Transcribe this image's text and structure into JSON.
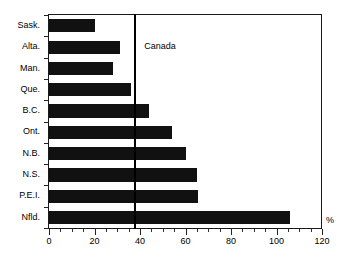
{
  "chart_data": {
    "type": "bar",
    "orientation": "horizontal",
    "title": "",
    "xlabel": "%",
    "ylabel": "",
    "categories": [
      "Sask.",
      "Alta.",
      "Man.",
      "Que.",
      "B.C.",
      "Ont.",
      "N.B.",
      "N.S.",
      "P.E.I.",
      "Nfld."
    ],
    "values": [
      20,
      31,
      28,
      36,
      44,
      54,
      60,
      65,
      65.5,
      106
    ],
    "xlim": [
      0,
      120
    ],
    "xticks": [
      0,
      20,
      40,
      60,
      80,
      100,
      120
    ],
    "xtick_labels": [
      "0",
      "20",
      "40",
      "60",
      "80",
      "100",
      "120"
    ],
    "minor_tick_interval": 5,
    "grid": false,
    "legend": null,
    "bar_color": "#111111",
    "reference_line": {
      "label": "Canada",
      "value": 37.5,
      "color": "#000000"
    },
    "axis_unit_label": "%"
  }
}
